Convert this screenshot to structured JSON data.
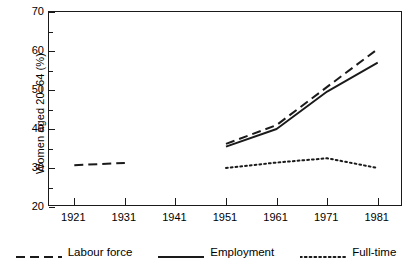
{
  "chart_data": {
    "type": "line",
    "title": "",
    "xlabel": "",
    "ylabel": "Women aged 20–64 (%)",
    "x": [
      1921,
      1931,
      1941,
      1951,
      1961,
      1971,
      1981
    ],
    "xlim": [
      1916,
      1986
    ],
    "ylim": [
      20,
      70
    ],
    "y_ticks": [
      20,
      30,
      40,
      50,
      60,
      70
    ],
    "y_minor_ticks": [
      25,
      35,
      45,
      55,
      65
    ],
    "x_ticks": [
      1921,
      1931,
      1941,
      1951,
      1961,
      1971,
      1981
    ],
    "x_tick_labels": [
      "1921",
      "1931",
      "1941",
      "1951",
      "1961",
      "1971",
      "1981"
    ],
    "y_tick_labels": [
      "20",
      "30",
      "40",
      "50",
      "60",
      "70"
    ],
    "grid": false,
    "legend_position": "bottom",
    "series": [
      {
        "name": "Labour force",
        "style": "dashed",
        "color": "#1a1a1a",
        "points": [
          {
            "x": 1921,
            "y": 30.7
          },
          {
            "x": 1931,
            "y": 31.3
          },
          {
            "x": 1951,
            "y": 36.2
          },
          {
            "x": 1961,
            "y": 41.0
          },
          {
            "x": 1971,
            "y": 50.8
          },
          {
            "x": 1981,
            "y": 60.5
          }
        ],
        "gap_after": 1931
      },
      {
        "name": "Employment",
        "style": "solid",
        "color": "#1a1a1a",
        "points": [
          {
            "x": 1951,
            "y": 35.5
          },
          {
            "x": 1961,
            "y": 40.0
          },
          {
            "x": 1971,
            "y": 49.6
          },
          {
            "x": 1981,
            "y": 57.0
          }
        ]
      },
      {
        "name": "Full-time",
        "style": "dotted",
        "color": "#1a1a1a",
        "points": [
          {
            "x": 1951,
            "y": 30.0
          },
          {
            "x": 1961,
            "y": 31.4
          },
          {
            "x": 1971,
            "y": 32.5
          },
          {
            "x": 1981,
            "y": 30.0
          }
        ]
      }
    ]
  },
  "legend": {
    "items": [
      {
        "label": "Labour force",
        "style": "dashed"
      },
      {
        "label": "Employment",
        "style": "solid"
      },
      {
        "label": "Full-time",
        "style": "dotted"
      }
    ]
  },
  "colors": {
    "ink": "#1a1a1a",
    "background": "#ffffff"
  }
}
